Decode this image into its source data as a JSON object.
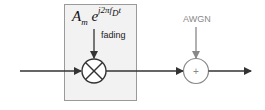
{
  "diagram": {
    "fading_block": {
      "formula_base": "A",
      "formula_sub": "m",
      "formula_e": " e",
      "formula_exp": "j2πf",
      "formula_exp_sub": "D",
      "formula_exp_tail": "t",
      "label": "fading"
    },
    "noise": {
      "label": "AWGN"
    },
    "adder": {
      "symbol": "+"
    },
    "colors": {
      "main": "#333333",
      "noise": "#888888",
      "box_fill": "#f2f2f2"
    }
  }
}
